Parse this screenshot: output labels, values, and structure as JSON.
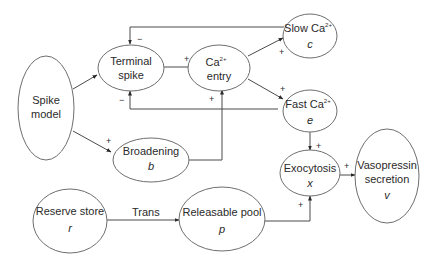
{
  "diagram": {
    "type": "flow diagram",
    "nodes": {
      "spike_model": {
        "line1": "Spike",
        "line2": "model"
      },
      "terminal_spike": {
        "line1": "Terminal",
        "line2": "spike"
      },
      "ca_entry": {
        "line1": "Ca",
        "sup": "2+",
        "line2": "entry"
      },
      "slow_ca": {
        "line1": "Slow Ca",
        "sup": "2+",
        "var": "c"
      },
      "fast_ca": {
        "line1": "Fast Ca",
        "sup": "2+",
        "var": "e"
      },
      "broadening": {
        "line1": "Broadening",
        "var": "b"
      },
      "exocytosis": {
        "line1": "Exocytosis",
        "var": "x"
      },
      "vasopressin": {
        "line1": "Vasopressin",
        "line2": "secretion",
        "var": "v"
      },
      "reserve_store": {
        "line1": "Reserve store",
        "var": "r"
      },
      "releasable_pool": {
        "line1": "Releasable pool",
        "var": "p"
      }
    },
    "edges": [
      {
        "from": "Spike model",
        "to": "Terminal spike",
        "sign": ""
      },
      {
        "from": "Spike model",
        "to": "Broadening",
        "sign": "+"
      },
      {
        "from": "Terminal spike",
        "to": "Ca2+ entry",
        "sign": "+"
      },
      {
        "from": "Broadening",
        "to": "Ca2+ entry",
        "sign": "+"
      },
      {
        "from": "Ca2+ entry",
        "to": "Slow Ca2+",
        "sign": "+"
      },
      {
        "from": "Ca2+ entry",
        "to": "Fast Ca2+",
        "sign": "+"
      },
      {
        "from": "Slow Ca2+",
        "to": "Terminal spike",
        "sign": "−"
      },
      {
        "from": "Fast Ca2+",
        "to": "Terminal spike",
        "sign": "−"
      },
      {
        "from": "Fast Ca2+",
        "to": "Exocytosis",
        "sign": "+"
      },
      {
        "from": "Releasable pool",
        "to": "Exocytosis",
        "sign": "+"
      },
      {
        "from": "Exocytosis",
        "to": "Vasopressin secretion",
        "sign": "+"
      },
      {
        "from": "Reserve store",
        "to": "Releasable pool",
        "label": "Trans"
      }
    ],
    "signs": {
      "plus": "+",
      "minus": "−"
    },
    "trans_label": "Trans"
  }
}
